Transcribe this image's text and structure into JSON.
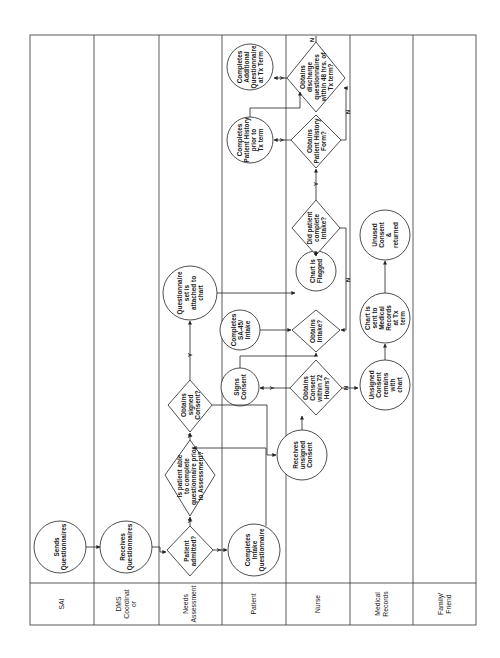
{
  "diagram": {
    "type": "swimlane-flowchart",
    "orientation": "rotated-90-ccw",
    "lanes": [
      {
        "id": "sai",
        "label": "SAI"
      },
      {
        "id": "dms",
        "label": "DMS\nCoordinat\nor"
      },
      {
        "id": "needs",
        "label": "Needs\nAssessment"
      },
      {
        "id": "patient",
        "label": "Patient"
      },
      {
        "id": "nurse",
        "label": "Nurse"
      },
      {
        "id": "medrec",
        "label": "Medical\nRecords"
      },
      {
        "id": "family",
        "label": "Family/\nFriend"
      }
    ],
    "nodes": {
      "sends_q": "Sends\nQuestionnaires",
      "receives_q": "Receives\nQuestionnaires",
      "admitted": "Patient\nadmitted?",
      "able_complete": "Is patient able\nto complete\nquestionnaire prior\nto Assessment?",
      "obtains_signed": "Obtains\nsigned\nConsent?",
      "q_attached": "Questionnaire\nset is\nattached to\nchart",
      "completes_intake_q": "Completes\nIntake\nQuestionnaire",
      "signs_consent": "Signs\nConsent",
      "completes_sa45": "Completes\nSA-45/\nIntake",
      "completes_history": "Completes\nPatient History\nprior to\nTx term",
      "completes_additional": "Completes\nAdditional\nQuestionnaire\nat Tx Term",
      "receives_unsigned": "Receives\nunsigned\nConsent",
      "consent_72": "Obtains\nConsent\nwithin 72\nHours?",
      "obtains_intake": "Obtains\nIntake?",
      "chart_flagged": "Chart is\nFlagged",
      "did_complete_intake": "Did patient\ncomplete\nIntake?",
      "obtains_history": "Obtains\nPatient History\nForm?",
      "discharge_q": "Obtains\ndischarge\nquestionnaires\nwithin 48 hrs. of\nTx term?",
      "unsigned_remains": "Unsigned\nConsent\nremains\nwith\nchart",
      "chart_sent": "Chart is\nsent to\nMedical\nRecords\nat Tx\nterm",
      "unused_returned": "Unused\nConsent\n&\nreturned"
    },
    "edge_labels": {
      "yes": "Y",
      "no": "N"
    }
  }
}
